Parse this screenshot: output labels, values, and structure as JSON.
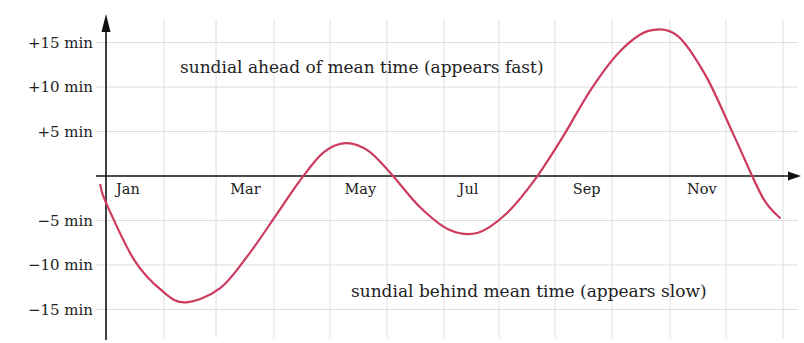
{
  "chart_data": {
    "type": "line",
    "title": "",
    "xlabel": "",
    "ylabel": "",
    "x_tick_labels": [
      "Jan",
      "Mar",
      "May",
      "Jul",
      "Sep",
      "Nov"
    ],
    "y_tick_labels": [
      "+15 min",
      "+10 min",
      "+5 min",
      "−5 min",
      "−10 min",
      "−15 min"
    ],
    "y_ticks": [
      15,
      10,
      5,
      -5,
      -10,
      -15
    ],
    "ylim": [
      -17,
      18
    ],
    "xlim_months": [
      0,
      12
    ],
    "grid": true,
    "legend": null,
    "annotations": {
      "upper": "sundial ahead of mean time (appears fast)",
      "lower": "sundial behind mean time (appears slow)"
    },
    "series": [
      {
        "name": "equation of time",
        "color": "#cc3b5e",
        "x_month": [
          -0.1,
          0.0,
          0.5,
          1.0,
          1.4,
          2.0,
          2.5,
          3.0,
          3.4,
          3.8,
          4.2,
          4.6,
          5.0,
          5.5,
          6.0,
          6.5,
          7.0,
          7.5,
          8.0,
          8.5,
          9.0,
          9.5,
          10.0,
          10.5,
          11.0,
          11.5,
          11.8
        ],
        "y_min": [
          -1.0,
          -3.0,
          -9.5,
          -13.0,
          -14.2,
          -12.6,
          -8.8,
          -4.2,
          -0.5,
          2.6,
          3.7,
          2.8,
          0.2,
          -3.5,
          -6.0,
          -6.4,
          -4.3,
          -0.5,
          4.4,
          9.8,
          14.0,
          16.3,
          15.8,
          11.3,
          4.5,
          -2.4,
          -4.7
        ]
      }
    ]
  }
}
